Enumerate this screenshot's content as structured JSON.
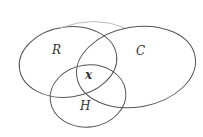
{
  "diagram": {
    "type": "venn",
    "sets": [
      {
        "id": "R",
        "label": "R"
      },
      {
        "id": "C",
        "label": "C"
      },
      {
        "id": "H",
        "label": "H"
      }
    ],
    "intersection_label": "x",
    "stroke_color": "#555555",
    "background": "#ffffff"
  }
}
